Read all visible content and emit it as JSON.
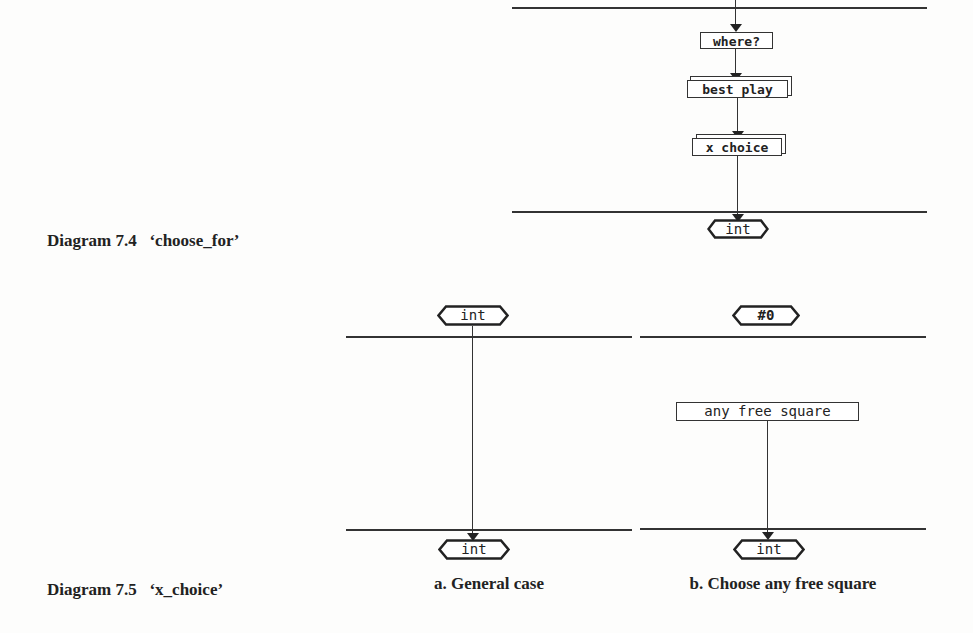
{
  "diagram_7_4": {
    "caption": "Diagram 7.4   ‘choose_for’",
    "nodes": {
      "where": "where?",
      "best_play": "best play",
      "x_choice": "x choice",
      "output": "int"
    }
  },
  "diagram_7_5": {
    "caption": "Diagram 7.5   ‘x_choice’",
    "panel_a": {
      "input": "int",
      "output": "int",
      "label": "a. General case"
    },
    "panel_b": {
      "input": "#0",
      "node": "any free square",
      "output": "int",
      "label": "b. Choose any free square"
    }
  }
}
